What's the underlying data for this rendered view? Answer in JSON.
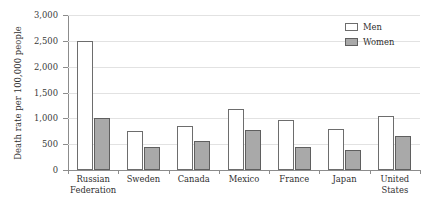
{
  "chart_data": {
    "type": "bar",
    "title": "",
    "subtitle": "",
    "xlabel": "",
    "ylabel": "Death rate per 100,000 people",
    "ylim": [
      0,
      3000
    ],
    "ytick_values": [
      0,
      500,
      1000,
      1500,
      2000,
      2500,
      3000
    ],
    "ytick_labels": [
      "0",
      "500",
      "1,000",
      "1,500",
      "2,000",
      "2,500",
      "3,000"
    ],
    "grid": true,
    "legend_position": "top-right",
    "categories": [
      "Russian Federation",
      "Sweden",
      "Canada",
      "Mexico",
      "France",
      "Japan",
      "United States"
    ],
    "category_lines": [
      [
        "Russian",
        "Federation"
      ],
      [
        "Sweden"
      ],
      [
        "Canada"
      ],
      [
        "Mexico"
      ],
      [
        "France"
      ],
      [
        "Japan"
      ],
      [
        "United",
        "States"
      ]
    ],
    "series": [
      {
        "name": "Men",
        "color": "#ffffff",
        "edge_color": "#6d6d6d",
        "values": [
          2500,
          750,
          860,
          1175,
          975,
          800,
          1050
        ]
      },
      {
        "name": "Women",
        "color": "#a9a9a9",
        "edge_color": "#5f5f5f",
        "values": [
          1000,
          450,
          560,
          770,
          450,
          380,
          650
        ]
      }
    ]
  },
  "legend": {
    "items": [
      {
        "label": "Men",
        "swatch": "men"
      },
      {
        "label": "Women",
        "swatch": "women"
      }
    ]
  },
  "colors": {
    "men_fill": "#ffffff",
    "women_fill": "#a9a9a9",
    "gridline": "#e2e2e2",
    "axis": "#8c8c8c",
    "text": "#2f2f2f"
  }
}
